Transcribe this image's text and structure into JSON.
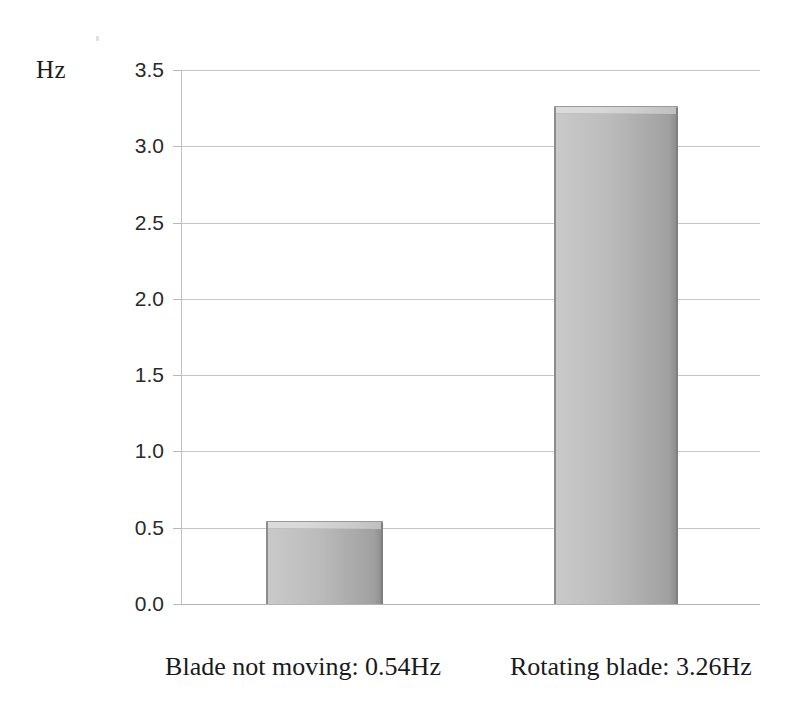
{
  "chart_data": {
    "type": "bar",
    "title": "",
    "subtitle": "",
    "xlabel": "",
    "ylabel": "Hz",
    "ylim": [
      0.0,
      3.5
    ],
    "ytick_step": 0.5,
    "yticks": [
      "3.5",
      "3.0",
      "2.5",
      "2.0",
      "1.5",
      "1.0",
      "0.5",
      "0.0"
    ],
    "ytick_values": [
      3.5,
      3.0,
      2.5,
      2.0,
      1.5,
      1.0,
      0.5,
      0.0
    ],
    "grid": true,
    "grid_axis": "y",
    "legend": false,
    "legend_position": "none",
    "categories": [
      "Blade not moving: 0.54Hz",
      "Rotating blade: 3.26Hz"
    ],
    "values": [
      0.54,
      3.26
    ],
    "series": [
      {
        "name": "Frequency",
        "values": [
          0.54,
          3.26
        ],
        "unit": "Hz"
      }
    ],
    "bar_style": "3d-bevel-gray",
    "annotations": []
  },
  "axis": {
    "unit_label": "Hz"
  },
  "colors": {
    "bar_light": "#c9c9c9",
    "bar_dark": "#8e8e8e",
    "bar_highlight": "#dcdcdc",
    "gridline": "#c6c6c6",
    "axis": "#c2c2c2",
    "text": "#1a1a1a",
    "background": "#ffffff"
  }
}
